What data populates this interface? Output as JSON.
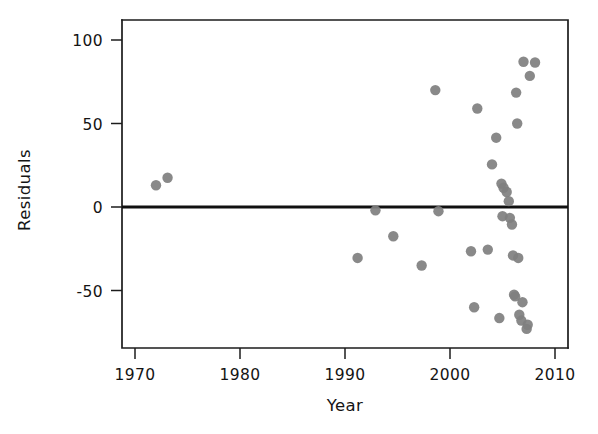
{
  "chart_data": {
    "type": "scatter",
    "title": "",
    "xlabel": "Year",
    "ylabel": "Residuals",
    "xlim": [
      1966.5,
      2011.2
    ],
    "ylim": [
      -87,
      112
    ],
    "grid": false,
    "legend": null,
    "xticks": [
      1970,
      1980,
      1990,
      2000,
      2010
    ],
    "xtick_labels": [
      "1970",
      "1980",
      "1990",
      "2000",
      "2010"
    ],
    "yticks": [
      -50,
      0,
      50,
      100
    ],
    "ytick_labels": [
      "-50",
      "0",
      "50",
      "100"
    ],
    "reference_line": {
      "orientation": "horizontal",
      "value": 0,
      "color": "#101010",
      "width": 3.2
    },
    "marker": {
      "shape": "circle",
      "color": "#7f7f7f",
      "size": 5.2,
      "opacity": 0.92
    },
    "x": [
      1972.0,
      1973.1,
      1991.2,
      1992.9,
      1994.6,
      1997.3,
      1998.6,
      1998.9,
      2002.0,
      2002.3,
      2002.6,
      2004.0,
      2004.4,
      2004.7,
      2005.1,
      2005.4,
      2005.6,
      2005.7,
      2005.9,
      2006.0,
      2006.1,
      2006.2,
      2006.3,
      2006.4,
      2006.6,
      2006.8,
      2007.0,
      2007.3,
      2007.6,
      2008.1,
      2003.6,
      2004.9,
      2005.0,
      2006.5,
      2006.9,
      2007.4
    ],
    "y": [
      13.0,
      17.5,
      -30.5,
      -2.0,
      -17.5,
      -35.0,
      70.0,
      -2.5,
      -26.5,
      -60.0,
      59.0,
      25.5,
      41.5,
      -66.5,
      11.5,
      9.0,
      3.5,
      -6.5,
      -10.5,
      -29.0,
      -52.5,
      -53.5,
      68.5,
      50.0,
      -64.5,
      -68.0,
      87.0,
      -73.0,
      78.5,
      86.5,
      -25.5,
      14.0,
      -5.5,
      -30.5,
      -57.0,
      -70.5
    ],
    "points": [
      {
        "x": 1972.0,
        "y": 13.0
      },
      {
        "x": 1973.1,
        "y": 17.5
      },
      {
        "x": 1991.2,
        "y": -30.5
      },
      {
        "x": 1992.9,
        "y": -2.0
      },
      {
        "x": 1994.6,
        "y": -17.5
      },
      {
        "x": 1997.3,
        "y": -35.0
      },
      {
        "x": 1998.6,
        "y": 70.0
      },
      {
        "x": 1998.9,
        "y": -2.5
      },
      {
        "x": 2002.0,
        "y": -26.5
      },
      {
        "x": 2002.3,
        "y": -60.0
      },
      {
        "x": 2002.6,
        "y": 59.0
      },
      {
        "x": 2003.6,
        "y": -25.5
      },
      {
        "x": 2004.0,
        "y": 25.5
      },
      {
        "x": 2004.4,
        "y": 41.5
      },
      {
        "x": 2004.7,
        "y": -66.5
      },
      {
        "x": 2004.9,
        "y": 14.0
      },
      {
        "x": 2005.0,
        "y": -5.5
      },
      {
        "x": 2005.1,
        "y": 11.5
      },
      {
        "x": 2005.4,
        "y": 9.0
      },
      {
        "x": 2005.6,
        "y": 3.5
      },
      {
        "x": 2005.7,
        "y": -6.5
      },
      {
        "x": 2005.9,
        "y": -10.5
      },
      {
        "x": 2006.0,
        "y": -29.0
      },
      {
        "x": 2006.1,
        "y": -52.5
      },
      {
        "x": 2006.2,
        "y": -53.5
      },
      {
        "x": 2006.3,
        "y": 68.5
      },
      {
        "x": 2006.4,
        "y": 50.0
      },
      {
        "x": 2006.5,
        "y": -30.5
      },
      {
        "x": 2006.6,
        "y": -64.5
      },
      {
        "x": 2006.8,
        "y": -68.0
      },
      {
        "x": 2006.9,
        "y": -57.0
      },
      {
        "x": 2007.0,
        "y": 87.0
      },
      {
        "x": 2007.3,
        "y": -73.0
      },
      {
        "x": 2007.4,
        "y": -70.5
      },
      {
        "x": 2007.6,
        "y": 78.5
      },
      {
        "x": 2008.1,
        "y": 86.5
      }
    ]
  },
  "layout": {
    "plot_left": 122,
    "plot_right": 568,
    "plot_top": 20,
    "plot_bottom": 348,
    "x_pixel_1970": 135,
    "x_pixel_2010": 555,
    "y_pixel_0": 207,
    "y_pixel_100": 40
  }
}
